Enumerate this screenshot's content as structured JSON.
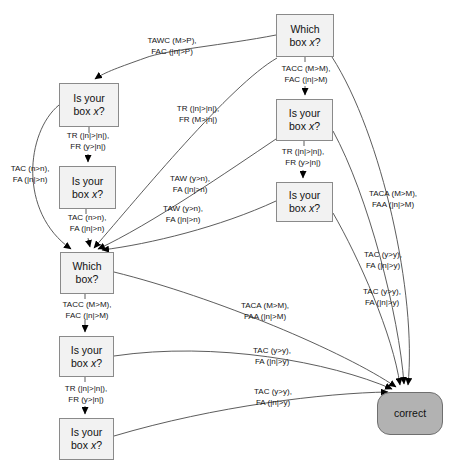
{
  "diagram": {
    "colors": {
      "background": "#ffffff",
      "box_fill": "#f2f2f2",
      "box_border": "#8a8a8a",
      "correct_fill": "#b2b2b2",
      "correct_border": "#6f6f6f",
      "edge_line": "#4a4a4a",
      "arrowhead": "#000000",
      "text": "#141414"
    },
    "nodes": [
      {
        "line1": "Which",
        "line2_pre": "box ",
        "line2_var": "x",
        "line2_post": "?"
      },
      {
        "line1": "Is your",
        "line2_pre": "box ",
        "line2_var": "x",
        "line2_post": "?"
      },
      {
        "line1": "Is your",
        "line2_pre": "box ",
        "line2_var": "x",
        "line2_post": "?"
      },
      {
        "line1": "Is your",
        "line2_pre": "box ",
        "line2_var": "x",
        "line2_post": "?"
      },
      {
        "line1": "Is your",
        "line2_pre": "box ",
        "line2_var": "x",
        "line2_post": "?"
      },
      {
        "line1": "Which",
        "line2_pre": "box?",
        "line2_var": "",
        "line2_post": ""
      },
      {
        "line1": "Is your",
        "line2_pre": "box ",
        "line2_var": "x",
        "line2_post": "?"
      },
      {
        "line1": "Is your",
        "line2_pre": "box ",
        "line2_var": "x",
        "line2_post": "?"
      },
      {
        "line1": "correct"
      }
    ],
    "edge_labels": [
      {
        "line1": "TAWC (M>P),",
        "line2": "FAC (|n|>P)"
      },
      {
        "line1": "TACC (M>M),",
        "line2": "FAC (|n|>M)"
      },
      {
        "line1": "TR (|n|>|n|),",
        "line2": "FR (M>|n|)"
      },
      {
        "line1": "TR (|n|>|n|),",
        "line2": "FR (y>|n|)"
      },
      {
        "line1": "TAC (n>n),",
        "line2": "FA (|n|>n)"
      },
      {
        "line1": "TR (|n|>|n|),",
        "line2": "FR (y>|n|)"
      },
      {
        "line1": "TAW (y>n),",
        "line2": "FA (|n|>n)"
      },
      {
        "line1": "TAW (y>n),",
        "line2": "FA (|n|>n)"
      },
      {
        "line1": "TAC (n>n),",
        "line2": "FA (|n|>n)"
      },
      {
        "line1": "TACA (M>M),",
        "line2": "FAA (|n|>M)"
      },
      {
        "line1": "TACC (M>M),",
        "line2": "FAC (|n|>M)"
      },
      {
        "line1": "TACA (M>M),",
        "line2": "FAA (|n|>M)"
      },
      {
        "line1": "TAC (y>y),",
        "line2": "FA (|n|>y)"
      },
      {
        "line1": "TAC (y>y),",
        "line2": "FA (|n|>y)"
      },
      {
        "line1": "TAC (y>y),",
        "line2": "FA (|n|>y)"
      },
      {
        "line1": "TR (|n|>|n|),",
        "line2": "FR (y>|n|)"
      },
      {
        "line1": "TAC (y>y),",
        "line2": "FA (|n|>y)"
      }
    ]
  }
}
